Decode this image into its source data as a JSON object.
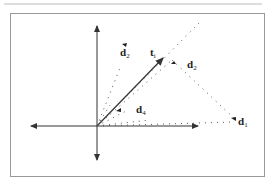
{
  "figure": {
    "colors": {
      "line": "#333333",
      "frame": "#999999",
      "dots": "#555555"
    },
    "labels": {
      "t": {
        "main": "t",
        "sub": "i"
      },
      "d1": {
        "main": "d",
        "sub": "1"
      },
      "d2": {
        "main": "d",
        "sub": "2"
      },
      "d3": {
        "main": "d",
        "sub": "3"
      },
      "d4": {
        "main": "d",
        "sub": "4"
      }
    }
  }
}
